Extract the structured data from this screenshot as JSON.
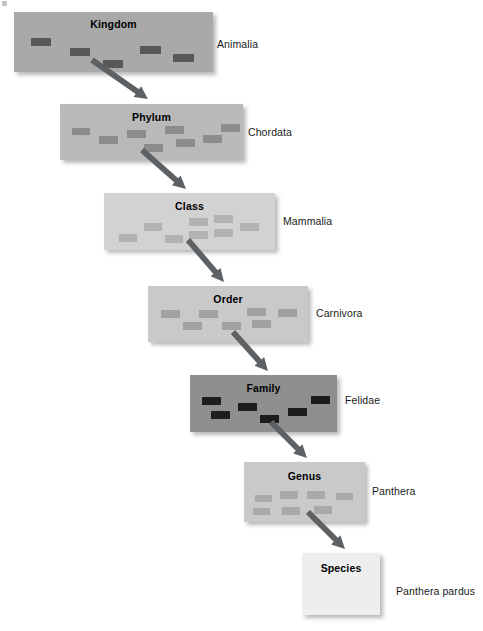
{
  "diagram": {
    "background_color": "#ffffff",
    "arrow_color": "#5e6164",
    "levels": [
      {
        "rank_label": "Kingdom",
        "taxon_name": "Animalia",
        "box": {
          "x": 14,
          "y": 12,
          "w": 199,
          "h": 60
        },
        "box_color": "#a9a9a9",
        "block_color": "#585858",
        "title_y": 6,
        "name_x": 217,
        "name_y": 38,
        "blocks": [
          {
            "x": 17,
            "y": 26,
            "w": 20,
            "h": 8
          },
          {
            "x": 56,
            "y": 36,
            "w": 20,
            "h": 8
          },
          {
            "x": 89,
            "y": 48,
            "w": 20,
            "h": 8
          },
          {
            "x": 126,
            "y": 34,
            "w": 21,
            "h": 8
          },
          {
            "x": 159,
            "y": 42,
            "w": 21,
            "h": 8
          }
        ]
      },
      {
        "rank_label": "Phylum",
        "taxon_name": "Chordata",
        "box": {
          "x": 60,
          "y": 104,
          "w": 183,
          "h": 56
        },
        "box_color": "#b9b9b9",
        "block_color": "#8c8c8c",
        "title_y": 7,
        "name_x": 248,
        "name_y": 126,
        "blocks": [
          {
            "x": 12,
            "y": 24,
            "w": 18,
            "h": 7
          },
          {
            "x": 39,
            "y": 32,
            "w": 19,
            "h": 8
          },
          {
            "x": 67,
            "y": 26,
            "w": 19,
            "h": 8
          },
          {
            "x": 84,
            "y": 40,
            "w": 19,
            "h": 8
          },
          {
            "x": 105,
            "y": 22,
            "w": 19,
            "h": 8
          },
          {
            "x": 116,
            "y": 35,
            "w": 19,
            "h": 8
          },
          {
            "x": 143,
            "y": 31,
            "w": 19,
            "h": 8
          },
          {
            "x": 161,
            "y": 20,
            "w": 19,
            "h": 8
          }
        ]
      },
      {
        "rank_label": "Class",
        "taxon_name": "Mammalia",
        "box": {
          "x": 104,
          "y": 193,
          "w": 171,
          "h": 57
        },
        "box_color": "#d2d2d2",
        "block_color": "#b2b2b2",
        "title_y": 7,
        "name_x": 283,
        "name_y": 215,
        "blocks": [
          {
            "x": 15,
            "y": 41,
            "w": 18,
            "h": 8
          },
          {
            "x": 40,
            "y": 30,
            "w": 18,
            "h": 8
          },
          {
            "x": 61,
            "y": 42,
            "w": 18,
            "h": 8
          },
          {
            "x": 85,
            "y": 25,
            "w": 19,
            "h": 8
          },
          {
            "x": 85,
            "y": 38,
            "w": 19,
            "h": 8
          },
          {
            "x": 110,
            "y": 22,
            "w": 19,
            "h": 8
          },
          {
            "x": 110,
            "y": 36,
            "w": 19,
            "h": 8
          },
          {
            "x": 136,
            "y": 30,
            "w": 19,
            "h": 8
          }
        ]
      },
      {
        "rank_label": "Order",
        "taxon_name": "Carnivora",
        "box": {
          "x": 148,
          "y": 286,
          "w": 160,
          "h": 56
        },
        "box_color": "#c9c9c9",
        "block_color": "#a1a1a1",
        "title_y": 7,
        "name_x": 316,
        "name_y": 307,
        "blocks": [
          {
            "x": 13,
            "y": 24,
            "w": 19,
            "h": 8
          },
          {
            "x": 35,
            "y": 36,
            "w": 19,
            "h": 8
          },
          {
            "x": 51,
            "y": 24,
            "w": 19,
            "h": 8
          },
          {
            "x": 74,
            "y": 36,
            "w": 19,
            "h": 8
          },
          {
            "x": 99,
            "y": 22,
            "w": 19,
            "h": 8
          },
          {
            "x": 104,
            "y": 34,
            "w": 19,
            "h": 8
          },
          {
            "x": 130,
            "y": 23,
            "w": 19,
            "h": 8
          }
        ]
      },
      {
        "rank_label": "Family",
        "taxon_name": "Felidae",
        "box": {
          "x": 190,
          "y": 375,
          "w": 147,
          "h": 57
        },
        "box_color": "#8f8f8f",
        "block_color": "#1d1d1d",
        "title_y": 7,
        "name_x": 345,
        "name_y": 394,
        "blocks": [
          {
            "x": 12,
            "y": 22,
            "w": 19,
            "h": 8
          },
          {
            "x": 21,
            "y": 36,
            "w": 19,
            "h": 8
          },
          {
            "x": 48,
            "y": 28,
            "w": 19,
            "h": 8
          },
          {
            "x": 70,
            "y": 40,
            "w": 19,
            "h": 8
          },
          {
            "x": 98,
            "y": 33,
            "w": 19,
            "h": 8
          },
          {
            "x": 121,
            "y": 21,
            "w": 19,
            "h": 8
          }
        ]
      },
      {
        "rank_label": "Genus",
        "taxon_name": "Panthera",
        "box": {
          "x": 244,
          "y": 462,
          "w": 121,
          "h": 60
        },
        "box_color": "#c9c9c9",
        "block_color": "#a9a9a9",
        "title_y": 8,
        "name_x": 372,
        "name_y": 485,
        "blocks": [
          {
            "x": 11,
            "y": 33,
            "w": 17,
            "h": 7
          },
          {
            "x": 9,
            "y": 46,
            "w": 17,
            "h": 7
          },
          {
            "x": 36,
            "y": 29,
            "w": 18,
            "h": 8
          },
          {
            "x": 38,
            "y": 45,
            "w": 18,
            "h": 8
          },
          {
            "x": 63,
            "y": 29,
            "w": 18,
            "h": 8
          },
          {
            "x": 70,
            "y": 44,
            "w": 18,
            "h": 8
          },
          {
            "x": 92,
            "y": 31,
            "w": 17,
            "h": 7
          }
        ]
      },
      {
        "rank_label": "Species",
        "taxon_name": "Panthera pardus",
        "box": {
          "x": 302,
          "y": 553,
          "w": 78,
          "h": 62
        },
        "box_color": "#eeeeee",
        "block_color": "#eeeeee",
        "title_y": 9,
        "name_x": 396,
        "name_y": 585,
        "blocks": []
      }
    ],
    "arrows": [
      {
        "from": "Kingdom",
        "to": "Phylum",
        "x1": 92,
        "y1": 60,
        "x2": 148,
        "y2": 99
      },
      {
        "from": "Phylum",
        "to": "Class",
        "x1": 142,
        "y1": 150,
        "x2": 186,
        "y2": 189
      },
      {
        "from": "Class",
        "to": "Order",
        "x1": 188,
        "y1": 240,
        "x2": 224,
        "y2": 282
      },
      {
        "from": "Order",
        "to": "Family",
        "x1": 233,
        "y1": 332,
        "x2": 268,
        "y2": 371
      },
      {
        "from": "Family",
        "to": "Genus",
        "x1": 271,
        "y1": 422,
        "x2": 307,
        "y2": 458
      },
      {
        "from": "Genus",
        "to": "Species",
        "x1": 308,
        "y1": 512,
        "x2": 345,
        "y2": 549
      }
    ]
  }
}
